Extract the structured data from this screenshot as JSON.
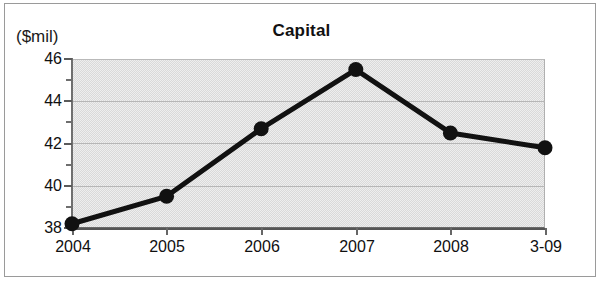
{
  "chart_data": {
    "type": "line",
    "title": "Capital",
    "unit_label": "($mil)",
    "xlabel": "",
    "ylabel": "",
    "categories": [
      "2004",
      "2005",
      "2006",
      "2007",
      "2008",
      "3-09"
    ],
    "values": [
      38.2,
      39.5,
      42.7,
      45.5,
      42.5,
      41.8
    ],
    "series": [
      {
        "name": "Capital",
        "values": [
          38.2,
          39.5,
          42.7,
          45.5,
          42.5,
          41.8
        ]
      }
    ],
    "ylim": [
      38,
      46
    ],
    "y_ticks": [
      38,
      40,
      42,
      44,
      46
    ],
    "y_tick_labels": [
      "38",
      "40",
      "42",
      "44",
      "46"
    ],
    "y_minor_ticks": [
      39,
      41,
      43,
      45
    ],
    "grid": true,
    "grid_axis": "y",
    "legend": false,
    "legend_position": "none",
    "marker": "filled-circle",
    "line_color": "#111111",
    "marker_color": "#111111",
    "plot_background": "#d9d9d9",
    "figure_background": "#ffffff",
    "border_color": "#9a9a9a"
  },
  "axes": {
    "y_axis_name": "capital-axis",
    "x_axis_name": "year-axis"
  }
}
